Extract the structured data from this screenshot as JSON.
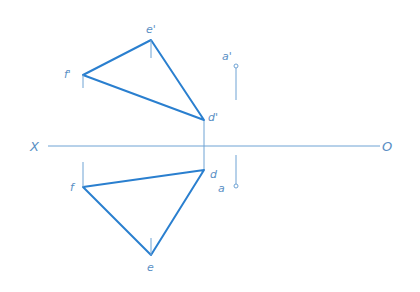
{
  "colors": {
    "edge": "#2a7fcf",
    "thin": "#6fa3d4",
    "label": "#5a8fc4",
    "background": "#ffffff"
  },
  "axis": {
    "left_label": "X",
    "right_label": "O",
    "y": 146,
    "x_start": 48,
    "x_end": 380
  },
  "vertical_view": {
    "triangle": {
      "e_prime": {
        "label": "e'",
        "x": 151,
        "y": 40
      },
      "f_prime": {
        "label": "f'",
        "x": 83,
        "y": 75
      },
      "d_prime": {
        "label": "d'",
        "x": 204,
        "y": 120
      }
    },
    "point": {
      "label": "a'",
      "x": 236,
      "y": 66
    }
  },
  "horizontal_view": {
    "triangle": {
      "f": {
        "label": "f",
        "x": 83,
        "y": 187
      },
      "d": {
        "label": "d",
        "x": 204,
        "y": 170
      },
      "e": {
        "label": "e",
        "x": 151,
        "y": 255
      }
    },
    "point": {
      "label": "a",
      "x": 236,
      "y": 186
    }
  }
}
